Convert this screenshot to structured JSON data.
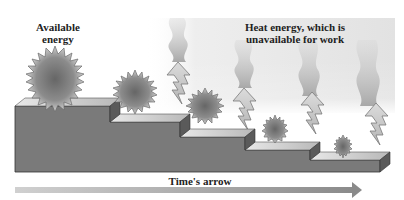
{
  "diagram": {
    "labels": {
      "available": "Available energy",
      "available_line1": "Available",
      "available_line2": "energy",
      "heat_line1": "Heat energy, which is",
      "heat_line2": "unavailable for work",
      "time_arrow": "Time's arrow"
    },
    "colors": {
      "step_front": "#7a7a7a",
      "step_side": "#5e5e5e",
      "step_top": "#cfcfcf",
      "sun_core": "#6a6a6a",
      "sun_edge": "#bdbdbd",
      "lightning": "#c8c8c8",
      "smoke": "#b9b9b9",
      "arrow": "#a8a8a8"
    },
    "steps": [
      {
        "index": 1,
        "sun_radius": 30
      },
      {
        "index": 2,
        "sun_radius": 22
      },
      {
        "index": 3,
        "sun_radius": 20
      },
      {
        "index": 4,
        "sun_radius": 14
      },
      {
        "index": 5,
        "sun_radius": 10
      }
    ],
    "heat_outputs": 4
  }
}
